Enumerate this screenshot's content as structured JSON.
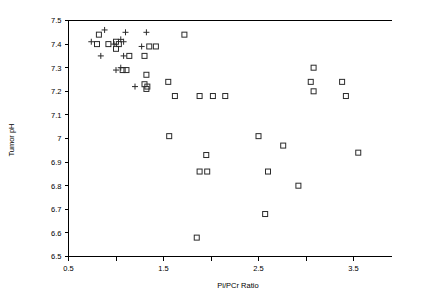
{
  "chart_data": {
    "type": "scatter",
    "title": "",
    "xlabel": "Pi/PCr Ratio",
    "ylabel": "Tumor pH",
    "xlim": [
      0.5,
      3.9
    ],
    "ylim": [
      6.5,
      7.5
    ],
    "xticks": [
      0.5,
      1.0,
      1.5,
      2.0,
      2.5,
      3.0,
      3.5
    ],
    "xtick_labels": [
      "0.5",
      "",
      "1.5",
      "",
      "2.5",
      "",
      "3.5"
    ],
    "yticks": [
      6.5,
      6.6,
      6.7,
      6.8,
      6.9,
      7.0,
      7.1,
      7.2,
      7.3,
      7.4,
      7.5
    ],
    "ytick_labels": [
      "6.5",
      "6.6",
      "6.7",
      "6.8",
      "6.9",
      "7",
      "7.1",
      "7.2",
      "7.3",
      "7.4",
      "7.5"
    ],
    "grid": false,
    "legend": "none",
    "marker_color": "#2b2b2b",
    "series": [
      {
        "name": "open-square",
        "marker": "square",
        "points": [
          [
            0.82,
            7.44
          ],
          [
            0.8,
            7.4
          ],
          [
            0.92,
            7.4
          ],
          [
            1.0,
            7.41
          ],
          [
            1.03,
            7.4
          ],
          [
            1.0,
            7.38
          ],
          [
            1.14,
            7.35
          ],
          [
            1.35,
            7.39
          ],
          [
            1.42,
            7.39
          ],
          [
            1.3,
            7.35
          ],
          [
            1.72,
            7.44
          ],
          [
            1.07,
            7.29
          ],
          [
            1.11,
            7.29
          ],
          [
            1.32,
            7.27
          ],
          [
            1.3,
            7.23
          ],
          [
            1.32,
            7.21
          ],
          [
            1.33,
            7.22
          ],
          [
            1.55,
            7.24
          ],
          [
            3.08,
            7.3
          ],
          [
            3.05,
            7.24
          ],
          [
            3.38,
            7.24
          ],
          [
            3.08,
            7.2
          ],
          [
            3.42,
            7.18
          ],
          [
            1.62,
            7.18
          ],
          [
            1.88,
            7.18
          ],
          [
            2.02,
            7.18
          ],
          [
            2.15,
            7.18
          ],
          [
            1.56,
            7.01
          ],
          [
            2.5,
            7.01
          ],
          [
            2.76,
            6.97
          ],
          [
            1.95,
            6.93
          ],
          [
            3.55,
            6.94
          ],
          [
            1.88,
            6.86
          ],
          [
            1.96,
            6.86
          ],
          [
            2.6,
            6.86
          ],
          [
            2.92,
            6.8
          ],
          [
            2.57,
            6.68
          ],
          [
            1.85,
            6.58
          ]
        ]
      },
      {
        "name": "plus",
        "marker": "plus",
        "points": [
          [
            0.88,
            7.46
          ],
          [
            1.1,
            7.45
          ],
          [
            1.32,
            7.45
          ],
          [
            0.74,
            7.41
          ],
          [
            1.05,
            7.42
          ],
          [
            1.08,
            7.41
          ],
          [
            0.98,
            7.4
          ],
          [
            1.27,
            7.39
          ],
          [
            0.84,
            7.35
          ],
          [
            1.08,
            7.35
          ],
          [
            1.0,
            7.29
          ],
          [
            1.05,
            7.3
          ],
          [
            1.2,
            7.22
          ]
        ]
      }
    ]
  },
  "axes": {
    "x_axis_name": "x-axis",
    "y_axis_name": "y-axis"
  }
}
